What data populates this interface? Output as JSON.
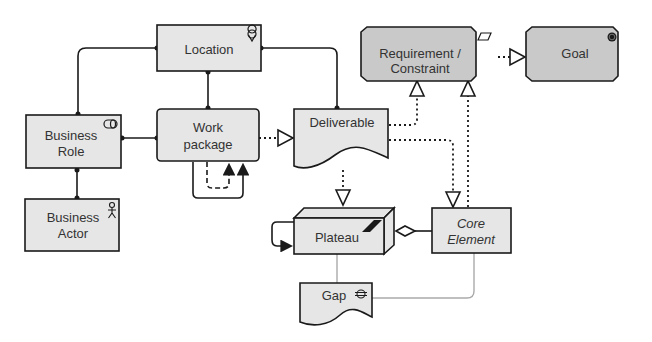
{
  "diagram": {
    "type": "ArchiMate implementation & migration metamodel",
    "colors": {
      "node_fill_light": "#e6e6e6",
      "node_fill_motivation": "#c9c9c9",
      "stroke": "#1a1a1a",
      "text": "#333333",
      "gap_line": "#aaaaaa"
    },
    "nodes": {
      "location": {
        "label": "Location",
        "icon": "location-pin-icon"
      },
      "business_role": {
        "label_line1": "Business",
        "label_line2": "Role",
        "icon": "role-icon"
      },
      "work_package": {
        "label_line1": "Work",
        "label_line2": "package",
        "icon": "none"
      },
      "deliverable": {
        "label": "Deliverable",
        "icon": "none"
      },
      "business_actor": {
        "label_line1": "Business",
        "label_line2": "Actor",
        "icon": "actor-stickman-icon"
      },
      "requirement": {
        "label_line1": "Requirement /",
        "label_line2": "Constraint",
        "icon": "parallelogram-icon"
      },
      "goal": {
        "label": "Goal",
        "icon": "target-icon"
      },
      "plateau": {
        "label": "Plateau",
        "icon": "plateau-steps-icon"
      },
      "core_element": {
        "label_line1": "Core",
        "label_line2": "Element",
        "icon": "none"
      },
      "gap": {
        "label": "Gap",
        "icon": "gap-icon"
      }
    },
    "relationships": [
      {
        "from": "location",
        "to": "business_role",
        "type": "association"
      },
      {
        "from": "location",
        "to": "work_package",
        "type": "association"
      },
      {
        "from": "location",
        "to": "deliverable",
        "type": "association"
      },
      {
        "from": "business_role",
        "to": "work_package",
        "type": "assignment"
      },
      {
        "from": "business_actor",
        "to": "business_role",
        "type": "assignment"
      },
      {
        "from": "work_package",
        "to": "deliverable",
        "type": "realization"
      },
      {
        "from": "work_package",
        "to": "work_package",
        "type": "triggering/flow"
      },
      {
        "from": "deliverable",
        "to": "requirement",
        "type": "realization"
      },
      {
        "from": "deliverable",
        "to": "plateau",
        "type": "realization"
      },
      {
        "from": "deliverable",
        "to": "core_element",
        "type": "realization"
      },
      {
        "from": "core_element",
        "to": "requirement",
        "type": "realization"
      },
      {
        "from": "requirement",
        "to": "goal",
        "type": "realization"
      },
      {
        "from": "core_element",
        "to": "plateau",
        "type": "aggregation"
      },
      {
        "from": "plateau",
        "to": "plateau",
        "type": "triggering"
      },
      {
        "from": "gap",
        "to": "plateau",
        "type": "association"
      },
      {
        "from": "gap",
        "to": "core_element",
        "type": "association"
      }
    ]
  }
}
